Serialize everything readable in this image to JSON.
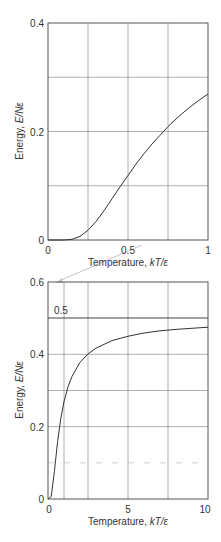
{
  "chart_data": [
    {
      "type": "line",
      "title": "",
      "xlabel": "Temperature, kT/ε",
      "ylabel": "Energy, E/Nε",
      "xlim": [
        0,
        1
      ],
      "ylim": [
        0,
        0.4
      ],
      "grid": true,
      "xticks": [
        0,
        0.5,
        1
      ],
      "xtick_labels": [
        "0",
        "0.5",
        "1"
      ],
      "yticks": [
        0,
        0.2,
        0.4
      ],
      "ytick_labels": [
        "0",
        "0.2",
        "0.4"
      ],
      "xgrid": [
        0.25,
        0.5,
        0.75
      ],
      "ygrid": [
        0.1,
        0.2,
        0.3
      ],
      "series": [
        {
          "name": "E/Nε",
          "x": [
            0,
            0.1,
            0.15,
            0.2,
            0.25,
            0.3,
            0.35,
            0.4,
            0.45,
            0.5,
            0.55,
            0.6,
            0.65,
            0.7,
            0.75,
            0.8,
            0.85,
            0.9,
            0.95,
            1.0
          ],
          "y": [
            0,
            0.0,
            0.0013,
            0.0067,
            0.018,
            0.034,
            0.054,
            0.076,
            0.098,
            0.119,
            0.14,
            0.159,
            0.177,
            0.193,
            0.209,
            0.223,
            0.236,
            0.248,
            0.259,
            0.269
          ]
        }
      ]
    },
    {
      "type": "line",
      "title": "",
      "xlabel": "Temperature, kT/ε",
      "ylabel": "Energy, E/Nε",
      "xlim": [
        0,
        10
      ],
      "ylim": [
        0,
        0.6
      ],
      "grid": true,
      "xticks": [
        0,
        5,
        10
      ],
      "xtick_labels": [
        "0",
        "5",
        "10"
      ],
      "yticks": [
        0,
        0.2,
        0.4,
        0.6
      ],
      "ytick_labels": [
        "0",
        "0.2",
        "0.4",
        "0.6"
      ],
      "xgrid": [
        1,
        2.5,
        5,
        7.5
      ],
      "ygrid": [
        0.1,
        0.2,
        0.3,
        0.4
      ],
      "annotations": [
        {
          "text": "0.5",
          "type": "horizontal-line",
          "y": 0.5
        }
      ],
      "series": [
        {
          "name": "E/Nε",
          "x": [
            0,
            0.2,
            0.4,
            0.6,
            0.8,
            1.0,
            1.25,
            1.5,
            2.0,
            2.5,
            3.0,
            4.0,
            5.0,
            6.0,
            7.0,
            8.0,
            9.0,
            10.0
          ],
          "y": [
            0,
            0.0067,
            0.076,
            0.159,
            0.223,
            0.269,
            0.31,
            0.339,
            0.378,
            0.401,
            0.417,
            0.438,
            0.45,
            0.459,
            0.465,
            0.469,
            0.472,
            0.475
          ]
        },
        {
          "name": "limit",
          "x": [
            0,
            10
          ],
          "y": [
            0.5,
            0.5
          ]
        }
      ]
    }
  ],
  "charts": {
    "top": {
      "ytick_labels": [
        "0.4",
        "0.2",
        "0"
      ],
      "xtick_labels": [
        "0",
        "0.5",
        "1"
      ],
      "xlabel_prefix": "Temperature, ",
      "xlabel_italic": "kT/ε",
      "ylabel_prefix": "Energy, ",
      "ylabel_italic": "E/Nε"
    },
    "bottom": {
      "ytick_labels": [
        "0.6",
        "0.4",
        "0.2",
        "0"
      ],
      "xtick_labels": [
        "0",
        "5",
        "10"
      ],
      "hline_label": "0.5",
      "xlabel_prefix": "Temperature, ",
      "xlabel_italic": "kT/ε",
      "ylabel_prefix": "Energy, ",
      "ylabel_italic": "E/Nε"
    }
  }
}
